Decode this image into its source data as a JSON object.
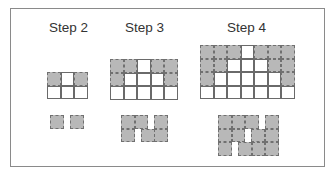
{
  "colors": {
    "gray_cell": "#b8b8b8",
    "white_cell": "#ffffff",
    "cell_border": "#6a6a6a",
    "dashed_border": "#707070",
    "frame_border": "#8a8a8a"
  },
  "steps": [
    {
      "label": "Step 2",
      "label_pos": [
        49,
        20
      ],
      "grid_origin": [
        47,
        72
      ],
      "grid": [
        [
          "g",
          "w",
          "g"
        ],
        [
          "w",
          "w",
          "w"
        ]
      ],
      "pieces": [
        [
          50,
          115
        ],
        [
          70,
          115
        ]
      ]
    },
    {
      "label": "Step 3",
      "label_pos": [
        125,
        20
      ],
      "grid_origin": [
        110,
        59
      ],
      "grid": [
        [
          "g",
          "g",
          "w",
          "g",
          "g"
        ],
        [
          "g",
          "w",
          "w",
          "w",
          "g"
        ],
        [
          "w",
          "w",
          "w",
          "w",
          "w"
        ]
      ],
      "pieces": [
        [
          121,
          115
        ],
        [
          134.5,
          115
        ],
        [
          154,
          115
        ],
        [
          121,
          128.5
        ],
        [
          141,
          128.5
        ],
        [
          154,
          128.5
        ]
      ]
    },
    {
      "label": "Step 4",
      "label_pos": [
        227,
        20
      ],
      "grid_origin": [
        200,
        45
      ],
      "grid": [
        [
          "g",
          "g",
          "g",
          "w",
          "g",
          "g",
          "g"
        ],
        [
          "g",
          "g",
          "w",
          "w",
          "w",
          "g",
          "g"
        ],
        [
          "g",
          "w",
          "w",
          "w",
          "w",
          "w",
          "g"
        ],
        [
          "w",
          "w",
          "w",
          "w",
          "w",
          "w",
          "w"
        ]
      ],
      "pieces": [
        [
          218,
          115
        ],
        [
          231.5,
          115
        ],
        [
          245,
          115
        ],
        [
          265,
          115
        ],
        [
          218,
          128.5
        ],
        [
          231.5,
          128.5
        ],
        [
          251,
          128.5
        ],
        [
          265,
          128.5
        ],
        [
          218,
          142
        ],
        [
          238,
          142
        ],
        [
          251.5,
          142
        ],
        [
          265,
          142
        ]
      ]
    }
  ]
}
